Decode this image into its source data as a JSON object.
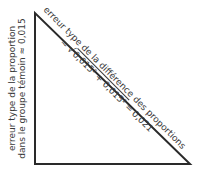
{
  "diagram": {
    "type": "right-triangle",
    "vertices": {
      "top": [
        35,
        13
      ],
      "bottom_left": [
        35,
        164
      ],
      "bottom_right": [
        190,
        164
      ]
    },
    "stroke_color": "#2a2a2a",
    "text_color": "#3a3a3a"
  },
  "vertical_side_label": {
    "line1": "erreur type de la proportion",
    "line2_prefix": "dans le groupe témoin",
    "approx_symbol": "≈",
    "value": "0,015"
  },
  "hypotenuse_label": {
    "line1": "erreur type de la différence des proportions",
    "approx_symbol": "≈",
    "sqrt_symbol": "√",
    "term1": "0,015",
    "exponent": "2",
    "plus": "+",
    "term2": "0,015",
    "equals": "=",
    "result": "0,021"
  }
}
